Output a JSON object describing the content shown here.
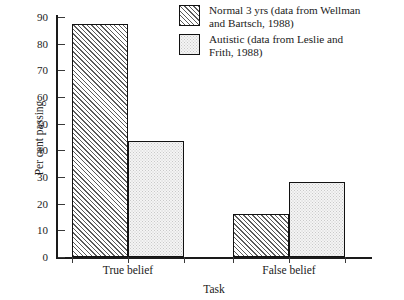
{
  "chart_data": {
    "type": "bar",
    "title": "",
    "xlabel": "Task",
    "ylabel": "Per cent passing",
    "categories": [
      "True belief",
      "False belief"
    ],
    "series": [
      {
        "name": "Normal 3 yrs (data from Wellman and Bartsch, 1988)",
        "short_name": "Normal 3 yrs",
        "pattern": "diagonal-hatch",
        "values": [
          87.5,
          16
        ]
      },
      {
        "name": "Autistic (data from Leslie and Frith, 1988)",
        "short_name": "Autistic",
        "pattern": "light-stipple",
        "values": [
          43.5,
          28
        ]
      }
    ],
    "ylim": [
      0,
      90
    ],
    "ytick_values": [
      0,
      10,
      20,
      30,
      40,
      50,
      60,
      70,
      80,
      90
    ],
    "ytick_labels": [
      "0",
      "10",
      "20",
      "30",
      "40",
      "50",
      "60",
      "70",
      "80",
      "90"
    ],
    "grid": false,
    "legend_position": "top-right"
  },
  "legend": {
    "entries": [
      {
        "line1": "Normal 3 yrs (data from Wellman",
        "line2": "and Bartsch, 1988)"
      },
      {
        "line1": "Autistic (data from Leslie and",
        "line2": "Frith, 1988)"
      }
    ]
  },
  "colors": {
    "axis": "#1a1a1a",
    "bar_outline": "#111111",
    "hatch_line": "#5b5b5b",
    "stipple_dot": "#c9c9c9",
    "background": "#ffffff"
  }
}
